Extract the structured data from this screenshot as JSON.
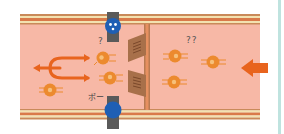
{
  "diagram": {
    "title": "",
    "colors": {
      "lumen": "#f7b8a6",
      "wall_outer": "#c98a5a",
      "wall_band": "#d97a4a",
      "wall_cream": "#f3e2b0",
      "arrow": "#e8641e",
      "cell": "#ec8a2e",
      "gate": "#a8704a",
      "gate_post": "#d98a55",
      "pump_blue": "#1f5fb4",
      "pump_grey": "#5a5a5a",
      "side_line": "#bfe3df"
    },
    "labels": {
      "question_single": "?",
      "question_double": "??",
      "pump_sound": "ポー"
    },
    "elements": {
      "flow_arrow_right": "incoming-flow-arrow",
      "fork_arrow_left": "branching-arrow",
      "gate": "valve-gate",
      "pump_top": "face-pump",
      "pump_bottom": "pump",
      "cells_count": 6
    }
  }
}
